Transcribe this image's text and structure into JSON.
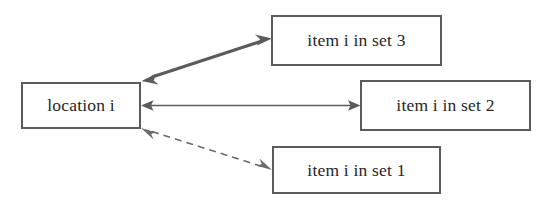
{
  "diagram": {
    "type": "node-edge-diagram",
    "background_color": "#ffffff",
    "nodes": [
      {
        "id": "location",
        "label": "location i",
        "border_color": "#5b5b5b",
        "fill_color": "#ffffff",
        "text_color": "#262626"
      },
      {
        "id": "set3",
        "label": "item i in set 3",
        "border_color": "#5b5b5b",
        "fill_color": "#ffffff",
        "text_color": "#262626"
      },
      {
        "id": "set2",
        "label": "item i in set 2",
        "border_color": "#5b5b5b",
        "fill_color": "#ffffff",
        "text_color": "#262626"
      },
      {
        "id": "set1",
        "label": "item i in set 1",
        "border_color": "#5b5b5b",
        "fill_color": "#ffffff",
        "text_color": "#262626"
      }
    ],
    "edges": [
      {
        "id": "edge-location-set3",
        "from": "location",
        "to": "set3",
        "style": "solid",
        "weight": "thick",
        "arrowheads": "both",
        "color": "#5b5b5b"
      },
      {
        "id": "edge-location-set2",
        "from": "location",
        "to": "set2",
        "style": "solid",
        "weight": "thin",
        "arrowheads": "both",
        "color": "#5b5b5b"
      },
      {
        "id": "edge-location-set1",
        "from": "location",
        "to": "set1",
        "style": "dashed",
        "weight": "thin",
        "arrowheads": "both",
        "color": "#6b6b6b"
      }
    ]
  }
}
